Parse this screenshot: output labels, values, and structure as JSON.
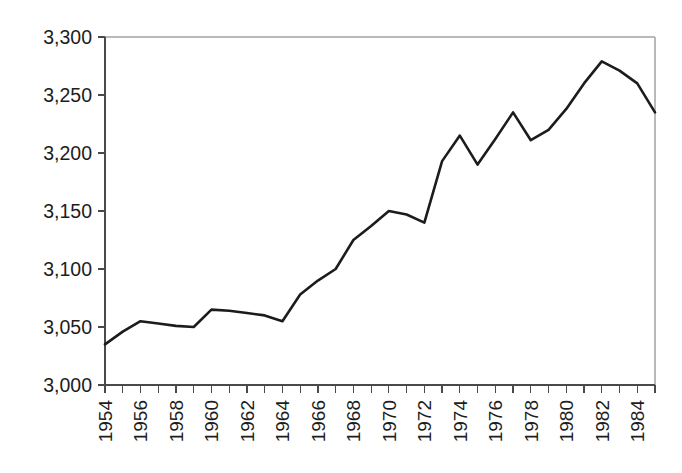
{
  "figure": {
    "caption_fragment": "",
    "background_color": "#ffffff",
    "line_color": "#1c1c1c",
    "axis_color": "#4a4a4a",
    "frame_color": "#b9b9b9"
  },
  "chart_data": {
    "type": "line",
    "title": "",
    "subtitle": "",
    "xlabel": "",
    "ylabel": "",
    "grid": false,
    "legend": false,
    "legend_position": "none",
    "xlim": [
      1954,
      1985
    ],
    "ylim": [
      3000,
      3300
    ],
    "ytick_values": [
      3000,
      3050,
      3100,
      3150,
      3200,
      3250,
      3300
    ],
    "ytick_labels": [
      "3,000",
      "3,050",
      "3,100",
      "3,150",
      "3,200",
      "3,250",
      "3,300"
    ],
    "xtick_values": [
      1954,
      1955,
      1956,
      1957,
      1958,
      1959,
      1960,
      1961,
      1962,
      1963,
      1964,
      1965,
      1966,
      1967,
      1968,
      1969,
      1970,
      1971,
      1972,
      1973,
      1974,
      1975,
      1976,
      1977,
      1978,
      1979,
      1980,
      1981,
      1982,
      1983,
      1984,
      1985
    ],
    "xtick_labels_shown": [
      "1954",
      "1956",
      "1958",
      "1960",
      "1962",
      "1964",
      "1966",
      "1968",
      "1970",
      "1972",
      "1974",
      "1976",
      "1978",
      "1980",
      "1982",
      "1984"
    ],
    "xtick_label_interval": 2,
    "xtick_label_rotation": -90,
    "x": [
      1954,
      1955,
      1956,
      1957,
      1958,
      1959,
      1960,
      1961,
      1962,
      1963,
      1964,
      1965,
      1966,
      1967,
      1968,
      1969,
      1970,
      1971,
      1972,
      1973,
      1974,
      1975,
      1976,
      1977,
      1978,
      1979,
      1980,
      1981,
      1982,
      1983,
      1984,
      1985
    ],
    "values": [
      3035,
      3046,
      3055,
      3053,
      3051,
      3050,
      3065,
      3064,
      3062,
      3060,
      3055,
      3078,
      3090,
      3100,
      3125,
      3137,
      3150,
      3147,
      3140,
      3193,
      3215,
      3190,
      3212,
      3235,
      3211,
      3220,
      3238,
      3260,
      3279,
      3271,
      3260,
      3235
    ],
    "series": [
      {
        "name": "series-1",
        "color": "#1c1c1c",
        "values": [
          3035,
          3046,
          3055,
          3053,
          3051,
          3050,
          3065,
          3064,
          3062,
          3060,
          3055,
          3078,
          3090,
          3100,
          3125,
          3137,
          3150,
          3147,
          3140,
          3193,
          3215,
          3190,
          3212,
          3235,
          3211,
          3220,
          3238,
          3260,
          3279,
          3271,
          3260,
          3235
        ]
      }
    ]
  }
}
